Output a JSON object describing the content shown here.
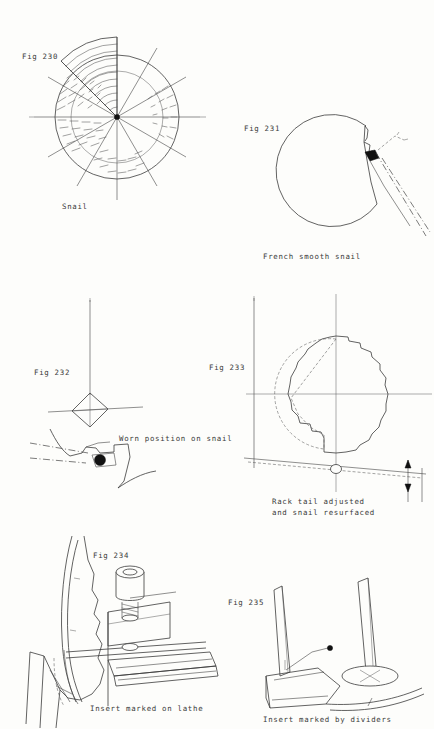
{
  "page": {
    "background_color": "#fdfdfb",
    "ink_color": "#3b3b3b",
    "kind": "scanned-technical-illustration-page"
  },
  "figures": [
    {
      "id": "fig-230",
      "label": "Fig 230",
      "caption": "Snail",
      "subject": "snail-cam-12-step-radial",
      "description": "Twelve-sector stepped snail cam with radial spokes and hatched sectors"
    },
    {
      "id": "fig-231",
      "label": "Fig 231",
      "caption": "French smooth snail",
      "subject": "smooth-spiral-snail-with-rack-tail",
      "description": "Smooth spiral snail with single step and dash-dot rack tail positions"
    },
    {
      "id": "fig-232",
      "label": "Fig 232",
      "caption": "Worn position on snail",
      "subject": "worn-snail-step-detail",
      "description": "Diamond pivot above enlarged detail of worn snail step"
    },
    {
      "id": "fig-233",
      "label": "Fig 233",
      "caption": "Rack tail adjusted\nand snail resurfaced",
      "caption_line_1": "Rack tail adjusted",
      "caption_line_2": "and snail resurfaced",
      "subject": "resurfaced-snail-with-adjusted-rack-tail",
      "description": "Serrated snail profile with dashed original outline and rack tail datum"
    },
    {
      "id": "fig-234",
      "label": "Fig 234",
      "caption": "Insert marked on lathe",
      "subject": "insert-marked-on-lathe",
      "description": "Lathe toolpost with screw-clamped marker scribing an insert blank"
    },
    {
      "id": "fig-235",
      "label": "Fig 235",
      "caption": "Insert marked by dividers",
      "subject": "insert-marked-by-dividers",
      "description": "Pair of dividers stepping off an arc on an insert blank"
    }
  ]
}
